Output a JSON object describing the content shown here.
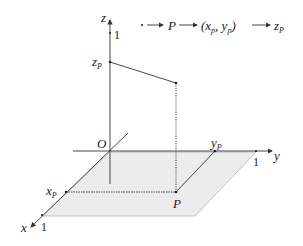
{
  "diagram": {
    "title_flow": {
      "items": [
        "·",
        "P",
        "(x",
        "p",
        ", y",
        "p",
        ")",
        "z",
        "p"
      ],
      "text": "· → P → (x_p, y_p) → z_p"
    },
    "axes": {
      "x_label": "x",
      "y_label": "y",
      "z_label": "z",
      "origin_label": "O",
      "x_tick": "1",
      "y_tick": "1",
      "z_tick": "1"
    },
    "points": {
      "P_label": "P",
      "xP_label": "x",
      "yP_label": "y",
      "zP_label": "z",
      "sub_p": "P"
    },
    "colors": {
      "line": "#333333",
      "plane_fill": "#ebebeb",
      "plane_stroke": "#aaaaaa"
    }
  }
}
